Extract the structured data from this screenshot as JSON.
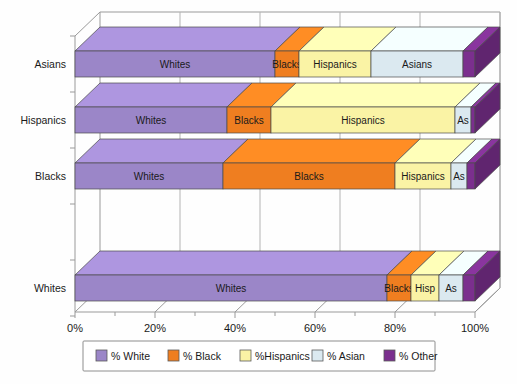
{
  "chart_data": {
    "type": "bar",
    "orientation": "horizontal",
    "stacked": true,
    "percent": true,
    "title": "",
    "subtitle": "",
    "xlabel": "",
    "ylabel": "",
    "xlim": [
      0,
      100
    ],
    "xtick_values": [
      0,
      10,
      20,
      30,
      40,
      50,
      60,
      70,
      80,
      90,
      100
    ],
    "xtick_labels": [
      "0%",
      "20%",
      "40%",
      "60%",
      "80%",
      "100%"
    ],
    "major_tick_values": [
      0,
      20,
      40,
      60,
      80,
      100
    ],
    "grid": "vertical-major",
    "legend_position": "bottom",
    "categories": [
      "Whites",
      "Blacks",
      "Hispanics",
      "Asians"
    ],
    "category_order_top_to_bottom": [
      "Asians",
      "Hispanics",
      "Blacks",
      "",
      "Whites"
    ],
    "series": [
      {
        "name": "% White",
        "color": "#9b86c8",
        "values": [
          78.0,
          37.0,
          38.0,
          50.0
        ]
      },
      {
        "name": "% Black",
        "color": "#ef7e20",
        "values": [
          6.0,
          43.0,
          11.0,
          6.0
        ]
      },
      {
        "name": "%Hispanics",
        "color": "#faf3a5",
        "values": [
          7.0,
          14.0,
          46.0,
          18.0
        ]
      },
      {
        "name": "% Asian",
        "color": "#dbe9f0",
        "values": [
          6.0,
          4.0,
          4.0,
          23.0
        ]
      },
      {
        "name": "% Other",
        "color": "#7b2f8e",
        "values": [
          3.0,
          2.0,
          1.0,
          3.0
        ]
      }
    ],
    "bar_segment_labels": {
      "Asians": [
        "Whites",
        "Blacks",
        "Hispanics",
        "Asians",
        ""
      ],
      "Hispanics": [
        "Whites",
        "Blacks",
        "Hispanics",
        "As",
        ""
      ],
      "Blacks": [
        "Whites",
        "Blacks",
        "Hispanics",
        "As",
        ""
      ],
      "Whites": [
        "Whites",
        "Blacks",
        "Hisp",
        "As",
        ""
      ]
    }
  },
  "legend": {
    "items": [
      {
        "label": "% White",
        "color": "#9b86c8"
      },
      {
        "label": "% Black",
        "color": "#ef7e20"
      },
      {
        "label": "%Hispanics",
        "color": "#faf3a5"
      },
      {
        "label": "% Asian",
        "color": "#dbe9f0"
      },
      {
        "label": "% Other",
        "color": "#7b2f8e"
      }
    ]
  },
  "axis": {
    "x_labels": [
      "0%",
      "20%",
      "40%",
      "60%",
      "80%",
      "100%"
    ],
    "y_labels": [
      "Asians",
      "Hispanics",
      "Blacks",
      "Whites"
    ]
  },
  "colors": {
    "white_series": "#9b86c8",
    "black_series": "#ef7e20",
    "hispanic_series": "#faf3a5",
    "asian_series": "#dbe9f0",
    "other_series": "#7b2f8e",
    "background": "#fefefe",
    "frame": "#9a9a9a",
    "grid": "#b4b4b4",
    "text": "#1a1a1a"
  }
}
